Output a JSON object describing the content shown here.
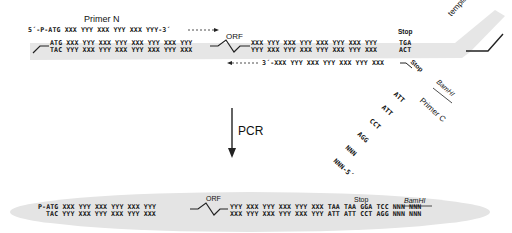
{
  "template_stage": {
    "primer_n": {
      "label": "Primer N",
      "sequence": "5´-P-ATG XXX YYY XXX YYY XXX YYY-3´"
    },
    "template_label": "template DNA",
    "top_strand_left": "ATG XXX YYY XXX YYY XXX YYY XXX YYY",
    "bottom_strand_left": "TAC YYY XXX YYY XXX YYY XXX YYY XXX",
    "orf_label": "ORF",
    "top_strand_right": "XXX YYY XXX YYY XXX YYY XXX YYY",
    "bottom_strand_right": "YYY XXX YYY XXX YYY XXX YYY XXX",
    "stop_label": "Stop",
    "stop_top": "TGA",
    "stop_bottom": "ACT",
    "primer_c": {
      "label": "Primer C",
      "sequence_linear": "3´-XXX YYY XXX YYY XXX YYY XXX",
      "stop_label": "Stop",
      "tail": [
        "ATT",
        "ATT",
        "CCT",
        "AGG",
        "NNN",
        "NNN-5´"
      ],
      "restriction_site": "BamHI"
    }
  },
  "arrow": {
    "label": "PCR"
  },
  "product_stage": {
    "top_left": "P-ATG XXX YYY XXX YYY XXX YYY",
    "bottom_left": "TAC YYY XXX YYY XXX YYY XXX",
    "orf_label": "ORF",
    "top_right": "YYY XXX YYY XXX YYY XXX TAA TAA GGA TCC NNN NNN",
    "bottom_right": "XXX YYY XXX YYY XXX YYY ATT ATT CCT AGG NNN NNN",
    "stop_label": "Stop",
    "restriction_site": "BamHI"
  }
}
